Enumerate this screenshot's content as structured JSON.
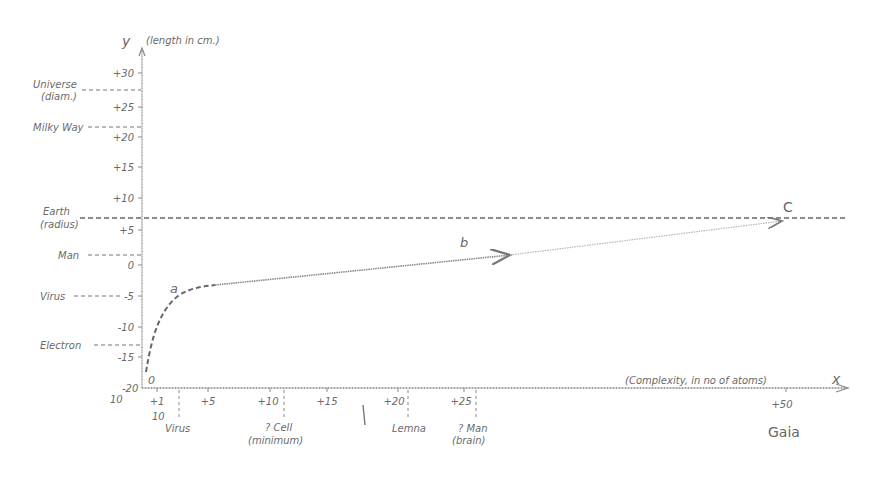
{
  "diagram": {
    "y_axis": {
      "symbol": "y",
      "label": "(length in cm.)"
    },
    "x_axis": {
      "symbol": "x",
      "label": "(Complexity, in no of atoms)"
    },
    "origin": {
      "label": "0",
      "base": "10",
      "exponent": "-20"
    },
    "y_ticks": [
      {
        "label": "+30",
        "y": 73
      },
      {
        "label": "+25",
        "y": 107
      },
      {
        "label": "+20",
        "y": 137
      },
      {
        "label": "+15",
        "y": 167
      },
      {
        "label": "+10",
        "y": 198
      },
      {
        "label": "+5",
        "y": 230
      },
      {
        "label": "0",
        "y": 265
      },
      {
        "label": "-5",
        "y": 296
      },
      {
        "label": "-10",
        "y": 327
      },
      {
        "label": "-15",
        "y": 357
      }
    ],
    "y_markers": [
      {
        "line1": "Universe",
        "line2": "(diam.)",
        "y": 90
      },
      {
        "line1": "Milky Way",
        "line2": "",
        "y": 127
      },
      {
        "line1": "Earth",
        "line2": "(radius)",
        "y": 218
      },
      {
        "line1": "Man",
        "line2": "",
        "y": 255
      },
      {
        "line1": "Virus",
        "line2": "",
        "y": 296
      },
      {
        "line1": "Electron",
        "line2": "",
        "y": 345
      }
    ],
    "x_ticks": [
      {
        "label": "+1",
        "sub": "10",
        "x": 157
      },
      {
        "label": "+5",
        "sub": "",
        "x": 208
      },
      {
        "label": "+10",
        "sub": "",
        "x": 270
      },
      {
        "label": "+15",
        "sub": "",
        "x": 327
      },
      {
        "label": "+20",
        "sub": "",
        "x": 398
      },
      {
        "label": "+25",
        "sub": "",
        "x": 464
      },
      {
        "label": "+50",
        "sub": "",
        "x": 786
      }
    ],
    "x_markers": [
      {
        "line1": "Virus",
        "line2": "",
        "x": 179
      },
      {
        "line1": "? Cell",
        "line2": "(minimum)",
        "x": 284
      },
      {
        "line1": "Lemna",
        "line2": "",
        "x": 408
      },
      {
        "line1": "? Man",
        "line2": "(brain)",
        "x": 476
      }
    ],
    "curve_points": {
      "a": "a",
      "b": "b",
      "c": "C"
    },
    "extra_label": "Gaia"
  }
}
